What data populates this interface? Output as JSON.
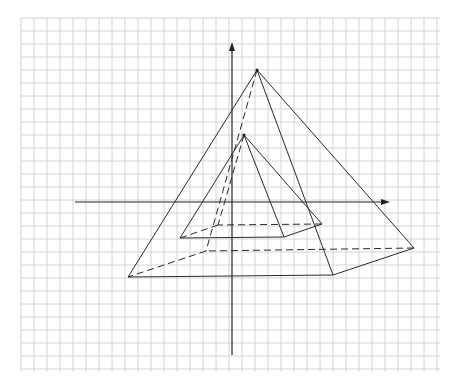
{
  "figure": {
    "description": "Two nested square pyramids drawn in oblique projection on graph paper with coordinate axes",
    "grid": {
      "x0": 21,
      "y0": 18,
      "x1": 440,
      "y1": 372,
      "cell": 13,
      "color": "#c9c9c9"
    },
    "axes": {
      "vertical": {
        "x": 232,
        "y_top": 42,
        "y_bottom": 355,
        "arrow": "up"
      },
      "horizontal": {
        "y": 202,
        "x_left": 75,
        "x_right": 390,
        "arrow": "right"
      }
    },
    "pyramids": [
      {
        "name": "large-pyramid",
        "apex": [
          257,
          70
        ],
        "base": {
          "front_left": [
            128,
            277
          ],
          "front_right": [
            333,
            275
          ],
          "back_right": [
            414,
            248
          ],
          "back_left": [
            206,
            251
          ]
        },
        "hidden_vertex": "back_left"
      },
      {
        "name": "small-pyramid",
        "apex": [
          244,
          135
        ],
        "base": {
          "front_left": [
            180,
            238
          ],
          "front_right": [
            284,
            237
          ],
          "back_right": [
            322,
            224
          ],
          "back_left": [
            218,
            225
          ]
        },
        "hidden_vertex": "back_left"
      }
    ],
    "line_styles": {
      "visible": "solid",
      "hidden": "dashed",
      "color": "#2a2a2a"
    }
  }
}
